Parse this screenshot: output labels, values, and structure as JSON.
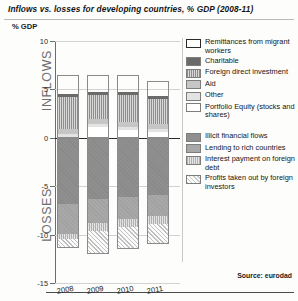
{
  "title": "Inflows vs. losses for developing countries, % GDP (2008-11)",
  "ylabel": "% GDP",
  "source": "Source: eurodad",
  "axis_words": {
    "inflows": "INFLOWS",
    "losses": "LOSSES"
  },
  "legend": {
    "inflow_items": [
      {
        "label": "Remittances from migrant workers",
        "key": "remittances",
        "color": "#121212"
      },
      {
        "label": "Charitable",
        "key": "charitable",
        "color": "#6a6a6a"
      },
      {
        "label": "Foreign direct investment",
        "key": "fdi",
        "color": "#8d8d8d"
      },
      {
        "label": "Aid",
        "key": "aid",
        "color": "#c6c6c6"
      },
      {
        "label": "Other",
        "key": "other",
        "color": "#e3e3e3"
      },
      {
        "label": "Portfolio Equity (stocks and shares)",
        "key": "portfolio",
        "color": "#ffffff"
      }
    ],
    "loss_items": [
      {
        "label": "Illicit financial flows",
        "key": "illicit",
        "color": "#8f8f8f"
      },
      {
        "label": "Lending to rich countries",
        "key": "lending",
        "color": "#a8a8a8"
      },
      {
        "label": "Interest payment on foreign debt",
        "key": "interest",
        "color": "#b2b2b2"
      },
      {
        "label": "Profits taken out by foreign investors",
        "key": "profits",
        "color": "#c9c9c9"
      }
    ]
  },
  "chart_data": {
    "type": "bar",
    "title": "Inflows vs. losses for developing countries, % GDP (2008-11)",
    "xlabel": "",
    "ylabel": "% GDP",
    "ylim": [
      -15,
      10
    ],
    "yticks": [
      10,
      5,
      0,
      -5,
      -10,
      -15
    ],
    "ytick_labels": [
      "10",
      "5",
      "0",
      "-5",
      "-10",
      "-15"
    ],
    "grid": true,
    "stacked": true,
    "legend_position": "right",
    "categories": [
      "2008",
      "2009",
      "2010",
      "2011"
    ],
    "series": [
      {
        "name": "Remittances from migrant workers",
        "key": "remittances",
        "group": "inflows",
        "values": [
          2.0,
          1.8,
          1.8,
          1.6
        ]
      },
      {
        "name": "Charitable",
        "key": "charitable",
        "group": "inflows",
        "values": [
          0.3,
          0.3,
          0.3,
          0.3
        ]
      },
      {
        "name": "Foreign direct investment",
        "key": "fdi",
        "group": "inflows",
        "values": [
          3.3,
          2.5,
          2.8,
          2.6
        ]
      },
      {
        "name": "Aid",
        "key": "aid",
        "group": "inflows",
        "values": [
          0.5,
          0.5,
          0.5,
          0.5
        ]
      },
      {
        "name": "Other",
        "key": "other",
        "group": "inflows",
        "values": [
          0.3,
          0.3,
          0.3,
          0.3
        ]
      },
      {
        "name": "Portfolio Equity (stocks and shares)",
        "key": "portfolio",
        "group": "inflows",
        "values": [
          0.1,
          1.1,
          0.8,
          0.6
        ]
      },
      {
        "name": "Illicit financial flows",
        "key": "illicit",
        "group": "losses",
        "values": [
          -6.8,
          -6.3,
          -6.1,
          -5.9
        ]
      },
      {
        "name": "Lending to rich countries",
        "key": "lending",
        "group": "losses",
        "values": [
          -3.1,
          -2.5,
          -2.3,
          -2.2
        ]
      },
      {
        "name": "Interest payment on foreign debt",
        "key": "interest",
        "group": "losses",
        "values": [
          -0.6,
          -0.8,
          -0.8,
          -0.8
        ]
      },
      {
        "name": "Profits taken out by foreign investors",
        "key": "profits",
        "group": "losses",
        "values": [
          -0.9,
          -2.4,
          -2.3,
          -2.1
        ]
      }
    ],
    "totals_inflows": [
      6.5,
      6.5,
      6.5,
      5.9
    ],
    "totals_losses": [
      -11.4,
      -12.0,
      -11.5,
      -11.0
    ],
    "source": "Source: eurodad"
  }
}
